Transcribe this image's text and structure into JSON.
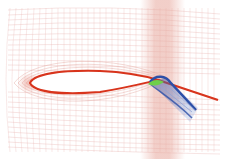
{
  "figure": {
    "colors": {
      "background": "#ffffff",
      "grid_line": "#e8b4b0",
      "grid_dense": "#d98a82",
      "wake_band": "#e7a79c",
      "airfoil_outline": "#d8341c",
      "airfoil_fill": "#ffffff",
      "wake_line": "#d8341c",
      "flap_grid": "#2c4fa8",
      "flap_grid_light": "#8fa3d6",
      "flap_core": "#6fcf4a"
    }
  }
}
